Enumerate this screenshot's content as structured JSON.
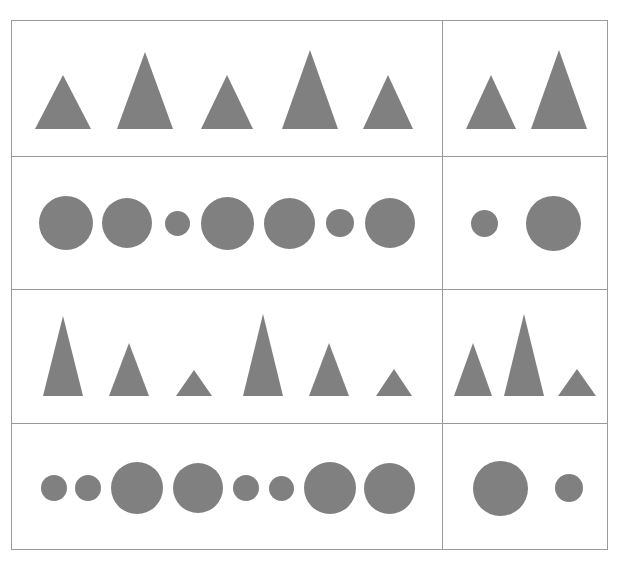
{
  "canvas": {
    "width": 622,
    "height": 563,
    "background": "#ffffff"
  },
  "figure": {
    "title": "",
    "shape_color": "#808080",
    "border_color": "#9a9a9a",
    "frame": {
      "x": 11,
      "y": 20,
      "width": 597,
      "height": 530
    },
    "column_divider_x": 430,
    "row_divider_ys": [
      135,
      268,
      402
    ]
  },
  "chart_data": {
    "type": "scatter",
    "title": "",
    "xlabel": "",
    "ylabel": "",
    "shape_color": "#808080",
    "rows": [
      {
        "row_index": 1,
        "shape": "triangle",
        "left_panel": {
          "panel_name": "row-1-sample-panel",
          "count": 5,
          "items": [
            {
              "width": 56,
              "height": 54,
              "x": 23,
              "baseline": 108
            },
            {
              "width": 57,
              "height": 77,
              "x": 105,
              "baseline": 108
            },
            {
              "width": 53,
              "height": 54,
              "x": 189,
              "baseline": 108
            },
            {
              "width": 56,
              "height": 79,
              "x": 270,
              "baseline": 108
            },
            {
              "width": 51,
              "height": 54,
              "x": 351,
              "baseline": 108
            }
          ]
        },
        "right_panel": {
          "panel_name": "row-1-target-panel",
          "count": 2,
          "items": [
            {
              "width": 51,
              "height": 54,
              "x": 24,
              "baseline": 108
            },
            {
              "width": 57,
              "height": 79,
              "x": 89,
              "baseline": 108
            }
          ]
        }
      },
      {
        "row_index": 2,
        "shape": "circle",
        "left_panel": {
          "panel_name": "row-2-sample-panel",
          "count": 7,
          "items": [
            {
              "diameter": 54,
              "x": 27,
              "center_y": 67
            },
            {
              "diameter": 50,
              "x": 90,
              "center_y": 67
            },
            {
              "diameter": 25,
              "x": 153,
              "center_y": 67
            },
            {
              "diameter": 53,
              "x": 189,
              "center_y": 67
            },
            {
              "diameter": 51,
              "x": 252,
              "center_y": 67
            },
            {
              "diameter": 28,
              "x": 314,
              "center_y": 67
            },
            {
              "diameter": 50,
              "x": 353,
              "center_y": 67
            }
          ]
        },
        "right_panel": {
          "panel_name": "row-2-target-panel",
          "count": 2,
          "items": [
            {
              "diameter": 27,
              "x": 29,
              "center_y": 67
            },
            {
              "diameter": 55,
              "x": 84,
              "center_y": 67
            }
          ]
        }
      },
      {
        "row_index": 3,
        "shape": "triangle",
        "left_panel": {
          "panel_name": "row-3-sample-panel",
          "count": 6,
          "items": [
            {
              "width": 40,
              "height": 80,
              "x": 31,
              "baseline": 107
            },
            {
              "width": 40,
              "height": 53,
              "x": 97,
              "baseline": 107
            },
            {
              "width": 37,
              "height": 26,
              "x": 164,
              "baseline": 107
            },
            {
              "width": 41,
              "height": 82,
              "x": 231,
              "baseline": 107
            },
            {
              "width": 40,
              "height": 53,
              "x": 297,
              "baseline": 107
            },
            {
              "width": 37,
              "height": 27,
              "x": 364,
              "baseline": 107
            }
          ]
        },
        "right_panel": {
          "panel_name": "row-3-target-panel",
          "count": 3,
          "items": [
            {
              "width": 39,
              "height": 53,
              "x": 12,
              "baseline": 107
            },
            {
              "width": 40,
              "height": 82,
              "x": 62,
              "baseline": 107
            },
            {
              "width": 38,
              "height": 27,
              "x": 116,
              "baseline": 107
            }
          ]
        }
      },
      {
        "row_index": 4,
        "shape": "circle",
        "left_panel": {
          "panel_name": "row-4-sample-panel",
          "count": 8,
          "items": [
            {
              "diameter": 26,
              "x": 29,
              "center_y": 65
            },
            {
              "diameter": 26,
              "x": 63,
              "center_y": 65
            },
            {
              "diameter": 52,
              "x": 99,
              "center_y": 65
            },
            {
              "diameter": 50,
              "x": 161,
              "center_y": 65
            },
            {
              "diameter": 26,
              "x": 221,
              "center_y": 65
            },
            {
              "diameter": 25,
              "x": 257,
              "center_y": 65
            },
            {
              "diameter": 52,
              "x": 292,
              "center_y": 65
            },
            {
              "diameter": 51,
              "x": 352,
              "center_y": 65
            }
          ]
        },
        "right_panel": {
          "panel_name": "row-4-target-panel",
          "count": 2,
          "items": [
            {
              "diameter": 55,
              "x": 31,
              "center_y": 65
            },
            {
              "diameter": 28,
              "x": 113,
              "center_y": 65
            }
          ]
        }
      }
    ]
  }
}
